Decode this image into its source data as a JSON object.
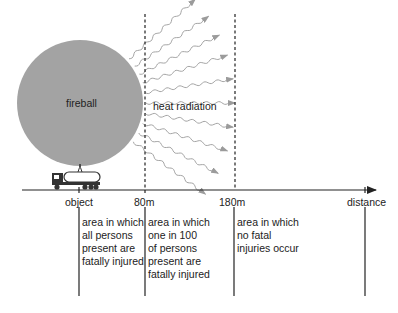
{
  "diagram": {
    "fireball_label": "fireball",
    "radiation_label": "heat radiation",
    "axis": {
      "markers": [
        {
          "id": "object",
          "label": "object"
        },
        {
          "id": "80m",
          "label": "80m"
        },
        {
          "id": "180m",
          "label": "180m"
        },
        {
          "id": "distance",
          "label": "distance"
        }
      ]
    },
    "zones": [
      {
        "id": "zone-1",
        "lines": [
          "area in which",
          "all persons",
          "present are",
          "fatally injured"
        ]
      },
      {
        "id": "zone-2",
        "lines": [
          "area in which",
          "one in 100",
          "of persons",
          "present are",
          "fatally injured"
        ]
      },
      {
        "id": "zone-3",
        "lines": [
          "area in which",
          "no fatal",
          "injuries occur"
        ]
      }
    ],
    "colors": {
      "fireball": "#a3a3a3",
      "rays": "#9b9b9b",
      "lines": "#222222",
      "truck": "#333333"
    }
  }
}
